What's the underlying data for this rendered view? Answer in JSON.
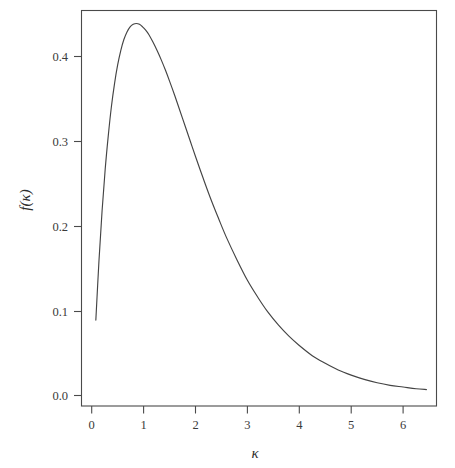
{
  "figure": {
    "background_color": "#ffffff",
    "line_color": "#444444",
    "axis_color": "#4a4a4a",
    "text_color": "#3a3a3a"
  },
  "chart_data": {
    "type": "line",
    "title": "",
    "subtitle": "",
    "xlabel": "κ",
    "ylabel": "f(κ)",
    "grid": false,
    "legend": null,
    "xlim": [
      -0.05,
      6.55
    ],
    "ylim": [
      -0.012,
      0.455
    ],
    "xticks": [
      0,
      1,
      2,
      3,
      4,
      5,
      6
    ],
    "xticklabels": [
      "0",
      "1",
      "2",
      "3",
      "4",
      "5",
      "6"
    ],
    "yticks": [
      0.0,
      0.1,
      0.2,
      0.3,
      0.4
    ],
    "yticklabels": [
      "0.0",
      "0.1",
      "0.2",
      "0.3",
      "0.4"
    ],
    "annotations": [],
    "series": [
      {
        "name": "f(κ)",
        "color": "#444444",
        "x": [
          0.08,
          0.14,
          0.2,
          0.26,
          0.32,
          0.38,
          0.44,
          0.5,
          0.56,
          0.62,
          0.68,
          0.74,
          0.8,
          0.86,
          0.92,
          0.98,
          1.04,
          1.1,
          1.18,
          1.26,
          1.34,
          1.42,
          1.5,
          1.6,
          1.7,
          1.8,
          1.9,
          2.0,
          2.15,
          2.3,
          2.45,
          2.6,
          2.8,
          3.0,
          3.2,
          3.4,
          3.6,
          3.8,
          4.0,
          4.25,
          4.5,
          4.75,
          5.0,
          5.25,
          5.5,
          5.75,
          6.0,
          6.25,
          6.45
        ],
        "y": [
          0.089,
          0.159,
          0.218,
          0.267,
          0.307,
          0.341,
          0.368,
          0.39,
          0.407,
          0.42,
          0.429,
          0.435,
          0.438,
          0.439,
          0.438,
          0.435,
          0.431,
          0.426,
          0.417,
          0.407,
          0.396,
          0.384,
          0.371,
          0.354,
          0.336,
          0.318,
          0.3,
          0.282,
          0.256,
          0.231,
          0.208,
          0.186,
          0.16,
          0.136,
          0.116,
          0.098,
          0.083,
          0.07,
          0.059,
          0.047,
          0.038,
          0.03,
          0.024,
          0.019,
          0.015,
          0.012,
          0.01,
          0.008,
          0.007
        ]
      }
    ],
    "peak": {
      "x": 0.85,
      "y": 0.439
    },
    "start_point": {
      "x": 0.08,
      "y": 0.089
    },
    "end_point": {
      "x": 6.45,
      "y": 0.007
    }
  }
}
